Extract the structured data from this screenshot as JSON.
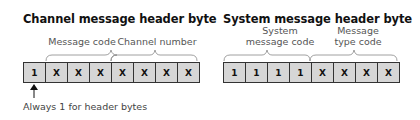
{
  "left_diagram": {
    "title": "Channel message header byte",
    "group_labels": [
      "Message code",
      "Channel number"
    ],
    "bits": [
      "1",
      "X",
      "X",
      "X",
      "X",
      "X",
      "X",
      "X"
    ],
    "annotation": "Always 1 for header bytes"
  },
  "right_diagram": {
    "title": "System message header byte",
    "group_labels": [
      "System\nmessage code",
      "Message\ntype code"
    ],
    "group_label_lines": [
      [
        "System",
        "message code"
      ],
      [
        "Message",
        "type code"
      ]
    ],
    "bits": [
      "1",
      "1",
      "1",
      "1",
      "X",
      "X",
      "X",
      "X"
    ]
  },
  "colors": {
    "cell_fill": "#d6d6d6",
    "border": "#333333",
    "label": "#555555"
  }
}
